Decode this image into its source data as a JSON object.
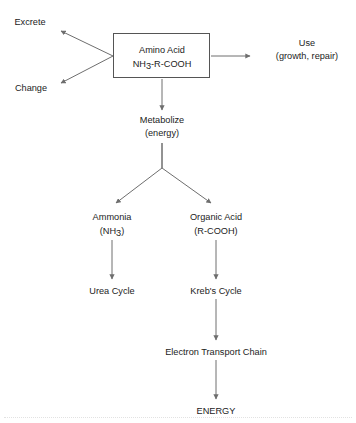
{
  "diagram": {
    "type": "flowchart",
    "background_color": "#ffffff",
    "text_color": "#1c1c1c",
    "edge_color": "#6e6e6e",
    "box_border_color": "#555555",
    "nodes": {
      "excrete": {
        "label": "Excrete",
        "x": 30,
        "y": 25
      },
      "change": {
        "label": "Change",
        "x": 31,
        "y": 91
      },
      "amino_acid": {
        "line1": "Amino Acid",
        "line2_pre": "NH",
        "line2_sub": "3",
        "line2_post": "-R-COOH",
        "x": 162,
        "y": 50,
        "box": {
          "x": 113,
          "y": 33,
          "width": 97,
          "height": 45
        }
      },
      "use": {
        "line1": "Use",
        "line2": "(growth, repair)",
        "x": 307,
        "y": 48
      },
      "metabolize": {
        "line1": "Metabolize",
        "line2": "(energy)",
        "x": 162,
        "y": 124
      },
      "ammonia": {
        "line1": "Ammonia",
        "line2_pre": "(NH",
        "line2_sub": "3",
        "line2_post": ")",
        "x": 112,
        "y": 221
      },
      "organic_acid": {
        "line1": "Organic Acid",
        "line2": "(R-COOH)",
        "x": 216,
        "y": 221
      },
      "urea_cycle": {
        "label": "Urea Cycle",
        "x": 112,
        "y": 294
      },
      "krebs_cycle": {
        "label": "Kreb's Cycle",
        "x": 216,
        "y": 294
      },
      "electron_transport_chain": {
        "label": "Electron Transport Chain",
        "x": 216,
        "y": 355
      },
      "energy": {
        "label": "ENERGY",
        "x": 216,
        "y": 414
      }
    },
    "edges": [
      {
        "name": "amino-acid-to-excrete",
        "from": "amino_acid",
        "to": "excrete"
      },
      {
        "name": "amino-acid-to-change",
        "from": "amino_acid",
        "to": "change"
      },
      {
        "name": "amino-acid-to-use",
        "from": "amino_acid",
        "to": "use"
      },
      {
        "name": "amino-acid-to-metabolize",
        "from": "amino_acid",
        "to": "metabolize"
      },
      {
        "name": "metabolize-to-ammonia",
        "from": "metabolize",
        "to": "ammonia"
      },
      {
        "name": "metabolize-to-organic-acid",
        "from": "metabolize",
        "to": "organic_acid"
      },
      {
        "name": "ammonia-to-urea-cycle",
        "from": "ammonia",
        "to": "urea_cycle"
      },
      {
        "name": "organic-acid-to-krebs-cycle",
        "from": "organic_acid",
        "to": "krebs_cycle"
      },
      {
        "name": "krebs-cycle-to-electron-transport-chain",
        "from": "krebs_cycle",
        "to": "electron_transport_chain"
      },
      {
        "name": "electron-transport-chain-to-energy",
        "from": "electron_transport_chain",
        "to": "energy"
      }
    ]
  }
}
